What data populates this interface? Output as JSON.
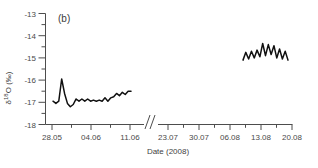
{
  "panel": {
    "label": "(b)"
  },
  "axes": {
    "y_title": "δ18O (‰)",
    "y_title_delta": "δ",
    "y_title_sup": "18",
    "y_title_rest": "O (‰)",
    "x_title": "Date (2008)",
    "y_ticklabels": [
      "-13",
      "-14",
      "-15",
      "-16",
      "-17",
      "-18"
    ],
    "x_ticklabels": [
      "28.05",
      "04.06",
      "11.06",
      "23.07",
      "30.07",
      "06.08",
      "13.08",
      "20.08"
    ],
    "axis_break": "broken-x-axis"
  },
  "chart_data": {
    "type": "line",
    "title": "(b)",
    "xlabel": "Date (2008)",
    "ylabel": "δ18O (‰)",
    "ylim": [
      -18,
      -13
    ],
    "yticks": [
      -13,
      -14,
      -15,
      -16,
      -17,
      -18
    ],
    "y_minor_ticks": true,
    "grid": false,
    "legend": false,
    "axis_break": {
      "present": true,
      "between": [
        "11.06",
        "23.07"
      ],
      "style": "double-slash"
    },
    "xticks": [
      "28.05",
      "04.06",
      "11.06",
      "23.07",
      "30.07",
      "06.08",
      "13.08",
      "20.08"
    ],
    "series": [
      {
        "name": "segment-1-late-may-to-june",
        "color": "#111111",
        "x": [
          "28.05",
          "28.06",
          "29.05",
          "30.05",
          "31.05",
          "01.06",
          "01.06",
          "02.06",
          "02.06",
          "03.06",
          "03.06",
          "04.06",
          "04.06",
          "05.06",
          "05.06",
          "06.06",
          "06.06",
          "07.06",
          "07.06",
          "08.06",
          "08.06",
          "09.06",
          "09.06",
          "10.06",
          "10.06",
          "11.06",
          "11.06",
          "12.06"
        ],
        "values": [
          -16.95,
          -17.05,
          -16.95,
          -15.95,
          -16.6,
          -17.05,
          -17.2,
          -17.1,
          -16.85,
          -16.95,
          -16.85,
          -16.95,
          -16.85,
          -16.95,
          -16.9,
          -16.95,
          -16.9,
          -16.95,
          -16.8,
          -16.95,
          -16.8,
          -16.75,
          -16.6,
          -16.7,
          -16.55,
          -16.65,
          -16.5,
          -16.5
        ]
      },
      {
        "name": "segment-2-august",
        "color": "#111111",
        "x": [
          "09.08",
          "09.08",
          "10.08",
          "10.08",
          "11.08",
          "11.08",
          "12.08",
          "12.08",
          "13.08",
          "13.08",
          "14.08",
          "14.08",
          "15.08",
          "15.08",
          "16.08",
          "16.08",
          "17.08"
        ],
        "values": [
          -15.1,
          -14.75,
          -15.05,
          -14.7,
          -15.0,
          -14.65,
          -14.95,
          -14.35,
          -14.9,
          -14.4,
          -14.85,
          -14.45,
          -15.0,
          -14.6,
          -15.05,
          -14.7,
          -15.1
        ]
      }
    ]
  },
  "colors": {
    "line": "#111111",
    "axis": "#4d4d4d",
    "text": "#3f3f3f",
    "background": "#ffffff"
  }
}
